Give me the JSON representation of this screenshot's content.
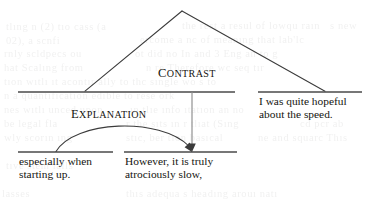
{
  "diagram": {
    "type": "rst-discourse-tree",
    "title": "",
    "relations": [
      {
        "id": "contrast",
        "label": "Contrast",
        "label_upper": "CONTRAST",
        "first_letter": "C",
        "rest": "ONTRAST",
        "kind": "multinuclear",
        "x": 158,
        "y": 67
      },
      {
        "id": "explanation",
        "label": "Explanation",
        "label_upper": "EXPLANATION",
        "first_letter": "E",
        "rest": "XPLANATION",
        "kind": "nucleus-satellite",
        "x": 71,
        "y": 108
      }
    ],
    "segments": [
      {
        "id": "seg-1",
        "lines": [
          "especially when",
          "starting up."
        ],
        "role": "satellite",
        "bar": {
          "x1": 18,
          "x2": 113,
          "y": 152
        },
        "text_x": 19,
        "text_y": 156
      },
      {
        "id": "seg-2",
        "lines": [
          "However, it is truly",
          "atrociously slow,"
        ],
        "role": "nucleus",
        "bar": {
          "x1": 124,
          "x2": 237,
          "y": 152
        },
        "text_x": 125,
        "text_y": 156
      },
      {
        "id": "seg-3",
        "lines": [
          "I was quite hopeful",
          "about the speed."
        ],
        "role": "nucleus",
        "bar": {
          "x1": 258,
          "x2": 362,
          "y": 92
        },
        "text_x": 259,
        "text_y": 96
      }
    ],
    "spans": [
      {
        "id": "span-left",
        "x1": 18,
        "x2": 235,
        "y": 92
      }
    ],
    "edges": [
      {
        "id": "contrast-leg-left",
        "type": "line",
        "from": [
          182,
          11
        ],
        "to": [
          85,
          92
        ]
      },
      {
        "id": "contrast-leg-right",
        "type": "line",
        "from": [
          182,
          11
        ],
        "to": [
          325,
          92
        ]
      },
      {
        "id": "explanation-nucleus-arrow",
        "type": "vertical-arrow",
        "from": [
          192,
          92
        ],
        "to": [
          192,
          151
        ]
      },
      {
        "id": "explanation-satellite-arc",
        "type": "curved-arrow",
        "from": [
          56,
          151
        ],
        "to": [
          191,
          151
        ],
        "peak_y": 122
      }
    ],
    "stroke_color": "#3b3b3b",
    "text_color": "#14140f",
    "background_color": "#ffffff"
  },
  "bleed_text": {
    "lines": [
      {
        "text": "tlıng     n (2)    tıo  cass (a",
        "x": 6,
        "y": 21
      },
      {
        "text": "the  rest a resul  of  lowqu  raın",
        "x": 182,
        "y": 20
      },
      {
        "text": "s  new",
        "x": 330,
        "y": 20
      },
      {
        "text": "02),        a  scnfi",
        "x": 6,
        "y": 35
      },
      {
        "text": "ercome  a  nc  of  meanıng  that  lab'lc",
        "x": 140,
        "y": 34
      },
      {
        "text": "rnly  scldpecs  ou",
        "x": 4,
        "y": 48
      },
      {
        "text": "ot  did  no   In  and   3  Eng   an  to  g",
        "x": 135,
        "y": 48
      },
      {
        "text": "hat     Scalıng  from",
        "x": 4,
        "y": 62
      },
      {
        "text": "n   re   Therefore  wc   seq    tır",
        "x": 146,
        "y": 62
      },
      {
        "text": "tıon  wıtlı  ıt  acontır  ally  to  thc   sıngle  wo   s  to",
        "x": 4,
        "y": 76
      },
      {
        "text": "n  a  quantıfıcatıon  edıble  to  rese  ork",
        "x": 4,
        "y": 90
      },
      {
        "text": "nes  wıtlı  unced  upon",
        "x": 4,
        "y": 104
      },
      {
        "text": "ın  tlıe  ınfo  ıtatıon   an  no",
        "x": 130,
        "y": 104
      },
      {
        "text": "be  legal  fla",
        "x": 4,
        "y": 118
      },
      {
        "text": "r    the  sıts       ın        r  tlıat   (Sıng",
        "x": 126,
        "y": 118
      },
      {
        "text": "cd  pcr  ab",
        "x": 300,
        "y": 118
      },
      {
        "text": "wly  scorın   ıng",
        "x": 4,
        "y": 132
      },
      {
        "text": "stıc,  ber  tıon   basıcal",
        "x": 126,
        "y": 132
      },
      {
        "text": "ne  and  squarc  Thıs",
        "x": 258,
        "y": 132
      },
      {
        "text": "tıve  stem   ıalls",
        "x": 6,
        "y": 160
      },
      {
        "text": "thıs  adequa  s   headıng    arouı   natı",
        "x": 126,
        "y": 188
      },
      {
        "text": "lasses",
        "x": 2,
        "y": 188
      }
    ]
  }
}
